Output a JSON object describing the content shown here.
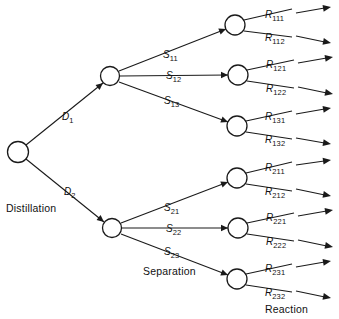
{
  "diagram": {
    "type": "tree",
    "ink_color": "#1a1a1a",
    "background": "#ffffff"
  },
  "stage_labels": [
    {
      "name": "stage-label-distillation",
      "text": "Distillation",
      "x": 6,
      "y": 203
    },
    {
      "name": "stage-label-separation",
      "text": "Separation",
      "x": 143,
      "y": 266
    },
    {
      "name": "stage-label-reaction",
      "text": "Reaction",
      "x": 265,
      "y": 304
    }
  ],
  "nodes": [
    {
      "id": "root",
      "name": "node-root-distillation",
      "cx": 18,
      "cy": 152,
      "r": 10.5
    },
    {
      "id": "d1",
      "name": "node-separation-d1",
      "cx": 110,
      "cy": 76,
      "r": 9.5
    },
    {
      "id": "d2",
      "name": "node-separation-d2",
      "cx": 112,
      "cy": 228,
      "r": 9.5
    },
    {
      "id": "s11",
      "name": "node-reaction-s11",
      "cx": 235,
      "cy": 25,
      "r": 10
    },
    {
      "id": "s12",
      "name": "node-reaction-s12",
      "cx": 238,
      "cy": 75,
      "r": 10
    },
    {
      "id": "s13",
      "name": "node-reaction-s13",
      "cx": 237,
      "cy": 126,
      "r": 10
    },
    {
      "id": "s21",
      "name": "node-reaction-s21",
      "cx": 237,
      "cy": 178,
      "r": 10
    },
    {
      "id": "s22",
      "name": "node-reaction-s22",
      "cx": 238,
      "cy": 228,
      "r": 10
    },
    {
      "id": "s23",
      "name": "node-reaction-s23",
      "cx": 237,
      "cy": 279,
      "r": 10
    }
  ],
  "decision_branches": [
    {
      "id": "D1",
      "name": "branch-d1",
      "label": "D",
      "sub": "1",
      "label_x": 62,
      "label_y": 112,
      "from": "root",
      "to": "d1"
    },
    {
      "id": "D2",
      "name": "branch-d2",
      "label": "D",
      "sub": "2",
      "label_x": 64,
      "label_y": 187,
      "from": "root",
      "to": "d2"
    }
  ],
  "separation_branches": [
    {
      "id": "S11",
      "name": "branch-s11",
      "label": "S",
      "sub": "11",
      "label_x": 163,
      "label_y": 50,
      "from": "d1",
      "to": "s11"
    },
    {
      "id": "S12",
      "name": "branch-s12",
      "label": "S",
      "sub": "12",
      "label_x": 166,
      "label_y": 71,
      "from": "d1",
      "to": "s12"
    },
    {
      "id": "S13",
      "name": "branch-s13",
      "label": "S",
      "sub": "13",
      "label_x": 164,
      "label_y": 96,
      "from": "d1",
      "to": "s13"
    },
    {
      "id": "S21",
      "name": "branch-s21",
      "label": "S",
      "sub": "21",
      "label_x": 164,
      "label_y": 203,
      "from": "d2",
      "to": "s21"
    },
    {
      "id": "S22",
      "name": "branch-s22",
      "label": "S",
      "sub": "22",
      "label_x": 166,
      "label_y": 224,
      "from": "d2",
      "to": "s22"
    },
    {
      "id": "S23",
      "name": "branch-s23",
      "label": "S",
      "sub": "23",
      "label_x": 164,
      "label_y": 247,
      "from": "d2",
      "to": "s23"
    }
  ],
  "reaction_outcomes": [
    {
      "id": "R111",
      "name": "outcome-r111",
      "label": "R",
      "sub": "111",
      "label_x": 265,
      "label_y": 10,
      "from": "s11",
      "tip_x": 330,
      "tip_y": 7
    },
    {
      "id": "R112",
      "name": "outcome-r112",
      "label": "R",
      "sub": "112",
      "label_x": 265,
      "label_y": 33,
      "from": "s11",
      "tip_x": 330,
      "tip_y": 43
    },
    {
      "id": "R121",
      "name": "outcome-r121",
      "label": "R",
      "sub": "121",
      "label_x": 266,
      "label_y": 60,
      "from": "s12",
      "tip_x": 330,
      "tip_y": 57
    },
    {
      "id": "R122",
      "name": "outcome-r122",
      "label": "R",
      "sub": "122",
      "label_x": 266,
      "label_y": 84,
      "from": "s12",
      "tip_x": 330,
      "tip_y": 94
    },
    {
      "id": "R131",
      "name": "outcome-r131",
      "label": "R",
      "sub": "131",
      "label_x": 265,
      "label_y": 112,
      "from": "s13",
      "tip_x": 330,
      "tip_y": 108
    },
    {
      "id": "R132",
      "name": "outcome-r132",
      "label": "R",
      "sub": "132",
      "label_x": 265,
      "label_y": 135,
      "from": "s13",
      "tip_x": 330,
      "tip_y": 144
    },
    {
      "id": "R211",
      "name": "outcome-r211",
      "label": "R",
      "sub": "211",
      "label_x": 265,
      "label_y": 163,
      "from": "s21",
      "tip_x": 330,
      "tip_y": 160
    },
    {
      "id": "R212",
      "name": "outcome-r212",
      "label": "R",
      "sub": "212",
      "label_x": 265,
      "label_y": 187,
      "from": "s21",
      "tip_x": 330,
      "tip_y": 196
    },
    {
      "id": "R221",
      "name": "outcome-r221",
      "label": "R",
      "sub": "221",
      "label_x": 266,
      "label_y": 213,
      "from": "s22",
      "tip_x": 330,
      "tip_y": 210
    },
    {
      "id": "R222",
      "name": "outcome-r222",
      "label": "R",
      "sub": "222",
      "label_x": 266,
      "label_y": 237,
      "from": "s22",
      "tip_x": 330,
      "tip_y": 247
    },
    {
      "id": "R231",
      "name": "outcome-r231",
      "label": "R",
      "sub": "231",
      "label_x": 265,
      "label_y": 264,
      "from": "s23",
      "tip_x": 330,
      "tip_y": 261
    },
    {
      "id": "R232",
      "name": "outcome-r232",
      "label": "R",
      "sub": "232",
      "label_x": 265,
      "label_y": 288,
      "from": "s23",
      "tip_x": 330,
      "tip_y": 298
    }
  ],
  "edges": [
    {
      "name": "edge-root-d1",
      "x1": 26,
      "y1": 145,
      "x2": 103,
      "y2": 83,
      "arrow": true
    },
    {
      "name": "edge-root-d2",
      "x1": 26,
      "y1": 159,
      "x2": 104,
      "y2": 222,
      "arrow": true
    },
    {
      "name": "edge-d1-s11",
      "x1": 119,
      "y1": 71,
      "x2": 226,
      "y2": 29,
      "arrow": true
    },
    {
      "name": "edge-d1-s12",
      "x1": 120,
      "y1": 76,
      "x2": 228,
      "y2": 75,
      "arrow": true
    },
    {
      "name": "edge-d1-s13",
      "x1": 119,
      "y1": 82,
      "x2": 228,
      "y2": 122,
      "arrow": true
    },
    {
      "name": "edge-d2-s21",
      "x1": 121,
      "y1": 223,
      "x2": 228,
      "y2": 182,
      "arrow": true
    },
    {
      "name": "edge-d2-s22",
      "x1": 122,
      "y1": 228,
      "x2": 228,
      "y2": 228,
      "arrow": true
    },
    {
      "name": "edge-d2-s23",
      "x1": 121,
      "y1": 234,
      "x2": 228,
      "y2": 275,
      "arrow": true
    },
    {
      "name": "edge-s11-r111",
      "x1": 244,
      "y1": 20,
      "x2": 292,
      "y2": 9,
      "arrow": false
    },
    {
      "name": "edge-s11-r112",
      "x1": 244,
      "y1": 31,
      "x2": 292,
      "y2": 37,
      "arrow": false
    },
    {
      "name": "edge-s12-r121",
      "x1": 247,
      "y1": 70,
      "x2": 294,
      "y2": 60,
      "arrow": false
    },
    {
      "name": "edge-s12-r122",
      "x1": 247,
      "y1": 81,
      "x2": 294,
      "y2": 88,
      "arrow": false
    },
    {
      "name": "edge-s13-r131",
      "x1": 246,
      "y1": 121,
      "x2": 292,
      "y2": 111,
      "arrow": false
    },
    {
      "name": "edge-s13-r132",
      "x1": 246,
      "y1": 132,
      "x2": 292,
      "y2": 139,
      "arrow": false
    },
    {
      "name": "edge-s21-r211",
      "x1": 246,
      "y1": 173,
      "x2": 292,
      "y2": 162,
      "arrow": false
    },
    {
      "name": "edge-s21-r212",
      "x1": 246,
      "y1": 184,
      "x2": 292,
      "y2": 191,
      "arrow": false
    },
    {
      "name": "edge-s22-r221",
      "x1": 247,
      "y1": 223,
      "x2": 294,
      "y2": 213,
      "arrow": false
    },
    {
      "name": "edge-s22-r222",
      "x1": 247,
      "y1": 234,
      "x2": 294,
      "y2": 241,
      "arrow": false
    },
    {
      "name": "edge-s23-r231",
      "x1": 246,
      "y1": 274,
      "x2": 292,
      "y2": 264,
      "arrow": false
    },
    {
      "name": "edge-s23-r232",
      "x1": 246,
      "y1": 285,
      "x2": 292,
      "y2": 292,
      "arrow": false
    }
  ],
  "terminal_arrows": [
    {
      "name": "terminal-arrow-r111",
      "x1": 296,
      "y1": 13,
      "x2": 331,
      "y2": 7
    },
    {
      "name": "terminal-arrow-r112",
      "x1": 296,
      "y1": 36,
      "x2": 331,
      "y2": 43
    },
    {
      "name": "terminal-arrow-r121",
      "x1": 298,
      "y1": 63,
      "x2": 333,
      "y2": 57
    },
    {
      "name": "terminal-arrow-r122",
      "x1": 298,
      "y1": 87,
      "x2": 333,
      "y2": 94
    },
    {
      "name": "terminal-arrow-r131",
      "x1": 296,
      "y1": 114,
      "x2": 331,
      "y2": 108
    },
    {
      "name": "terminal-arrow-r132",
      "x1": 296,
      "y1": 138,
      "x2": 331,
      "y2": 144
    },
    {
      "name": "terminal-arrow-r211",
      "x1": 296,
      "y1": 165,
      "x2": 331,
      "y2": 160
    },
    {
      "name": "terminal-arrow-r212",
      "x1": 296,
      "y1": 189,
      "x2": 331,
      "y2": 196
    },
    {
      "name": "terminal-arrow-r221",
      "x1": 298,
      "y1": 216,
      "x2": 333,
      "y2": 210
    },
    {
      "name": "terminal-arrow-r222",
      "x1": 298,
      "y1": 240,
      "x2": 333,
      "y2": 247
    },
    {
      "name": "terminal-arrow-r231",
      "x1": 296,
      "y1": 267,
      "x2": 331,
      "y2": 261
    },
    {
      "name": "terminal-arrow-r232",
      "x1": 296,
      "y1": 291,
      "x2": 331,
      "y2": 298
    }
  ]
}
